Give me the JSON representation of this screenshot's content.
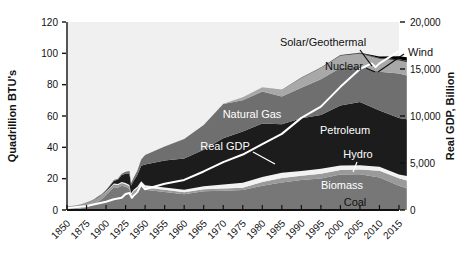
{
  "chart_data": {
    "type": "area",
    "title": "",
    "subtitle": "",
    "stacked": true,
    "grid": false,
    "legend_position": "inline-annotations",
    "xlabel": "",
    "ylabel": "Quadrillion BTU's",
    "y2label": "Real GDP, Billion",
    "ylim": [
      0,
      120
    ],
    "y2lim": [
      0,
      20000
    ],
    "yticks": [
      "0",
      "20",
      "40",
      "60",
      "80",
      "100",
      "120"
    ],
    "ytick_values": [
      0,
      20,
      40,
      60,
      80,
      100,
      120
    ],
    "y2ticks": [
      "0",
      "5,000",
      "10,000",
      "15,000",
      "20,000"
    ],
    "y2tick_values": [
      0,
      5000,
      10000,
      15000,
      20000
    ],
    "xticks": [
      "1850",
      "1875",
      "1900",
      "1925",
      "1950",
      "1955",
      "1960",
      "1965",
      "1970",
      "1975",
      "1980",
      "1985",
      "1990",
      "1995",
      "2000",
      "2005",
      "2010",
      "2015"
    ],
    "x": [
      1850,
      1855,
      1860,
      1865,
      1870,
      1875,
      1880,
      1885,
      1890,
      1895,
      1900,
      1905,
      1910,
      1915,
      1920,
      1925,
      1930,
      1932,
      1935,
      1940,
      1945,
      1950,
      1955,
      1960,
      1965,
      1970,
      1975,
      1980,
      1985,
      1990,
      1995,
      2000,
      2005,
      2010,
      2015,
      2017
    ],
    "series": [
      {
        "name": "Coal",
        "color": "#777777",
        "label_color": "#111111",
        "values": [
          0.2,
          0.3,
          0.5,
          0.8,
          1.2,
          1.8,
          2.6,
          3.8,
          5.5,
          7.2,
          9.5,
          12.0,
          14.5,
          14.2,
          15.5,
          14.8,
          13.6,
          8.5,
          10.5,
          12.5,
          15.5,
          12.9,
          11.5,
          10.1,
          11.9,
          12.3,
          12.7,
          15.4,
          17.5,
          19.2,
          20.1,
          22.6,
          22.8,
          20.8,
          15.5,
          13.9
        ]
      },
      {
        "name": "Biomass",
        "color": "#9a9a9a",
        "label_color": "#111111",
        "values": [
          2.1,
          2.2,
          2.4,
          2.5,
          2.6,
          2.7,
          2.8,
          2.7,
          2.6,
          2.4,
          2.2,
          2.0,
          1.9,
          1.8,
          1.7,
          1.6,
          1.5,
          1.4,
          1.4,
          1.4,
          1.4,
          1.5,
          1.4,
          1.3,
          1.3,
          1.4,
          1.5,
          2.5,
          2.9,
          2.7,
          3.0,
          3.0,
          3.1,
          4.3,
          4.7,
          5.0
        ]
      },
      {
        "name": "Hydro",
        "color": "#f2f2f2",
        "label_color": "#111111",
        "values": [
          0.0,
          0.0,
          0.0,
          0.0,
          0.0,
          0.0,
          0.0,
          0.0,
          0.05,
          0.1,
          0.25,
          0.4,
          0.5,
          0.6,
          0.7,
          0.8,
          0.8,
          0.8,
          0.9,
          0.9,
          1.4,
          1.4,
          1.4,
          1.6,
          2.0,
          2.6,
          3.2,
          3.1,
          3.4,
          3.0,
          3.2,
          2.8,
          2.7,
          2.5,
          2.4,
          2.8
        ]
      },
      {
        "name": "Petroleum",
        "color": "#1c1c1c",
        "label_color": "#ffffff",
        "values": [
          0.0,
          0.0,
          0.0,
          0.05,
          0.1,
          0.15,
          0.2,
          0.25,
          0.3,
          0.4,
          0.6,
          1.0,
          1.8,
          2.7,
          4.4,
          6.0,
          7.0,
          5.0,
          5.5,
          7.5,
          10.0,
          13.3,
          17.3,
          19.9,
          23.2,
          29.5,
          32.7,
          34.2,
          30.9,
          33.6,
          34.4,
          38.3,
          40.4,
          35.9,
          36.1,
          36.2
        ]
      },
      {
        "name": "Natural Gas",
        "color": "#6f6f6f",
        "label_color": "#ffffff",
        "values": [
          0.0,
          0.0,
          0.0,
          0.0,
          0.05,
          0.1,
          0.15,
          0.2,
          0.25,
          0.3,
          0.25,
          0.35,
          0.5,
          0.7,
          0.8,
          1.2,
          2.0,
          1.6,
          1.9,
          2.7,
          3.9,
          6.0,
          9.0,
          12.4,
          15.8,
          21.8,
          19.9,
          20.4,
          17.8,
          19.6,
          22.7,
          23.9,
          22.6,
          24.7,
          28.4,
          28.0
        ]
      },
      {
        "name": "Nuclear",
        "color": "#a8a8a8",
        "label_color": "#111111",
        "values": [
          0,
          0,
          0,
          0,
          0,
          0,
          0,
          0,
          0,
          0,
          0,
          0,
          0,
          0,
          0,
          0,
          0,
          0,
          0,
          0,
          0,
          0,
          0,
          0.04,
          0.04,
          0.24,
          1.9,
          2.7,
          4.1,
          6.1,
          7.2,
          7.9,
          8.2,
          8.4,
          8.4,
          8.4
        ]
      },
      {
        "name": "Solar/Geothermal",
        "color": "#3a3a3a",
        "label_color": "#111111",
        "values": [
          0,
          0,
          0,
          0,
          0,
          0,
          0,
          0,
          0,
          0,
          0,
          0,
          0,
          0,
          0,
          0,
          0,
          0,
          0,
          0,
          0,
          0,
          0,
          0.0,
          0.0,
          0.01,
          0.07,
          0.11,
          0.2,
          0.35,
          0.4,
          0.4,
          0.44,
          0.5,
          0.78,
          0.9
        ]
      },
      {
        "name": "Wind",
        "color": "#000000",
        "label_color": "#111111",
        "values": [
          0,
          0,
          0,
          0,
          0,
          0,
          0,
          0,
          0,
          0,
          0,
          0,
          0,
          0,
          0,
          0,
          0,
          0,
          0,
          0,
          0,
          0,
          0,
          0,
          0,
          0,
          0,
          0,
          0.0,
          0.03,
          0.03,
          0.06,
          0.18,
          0.92,
          1.78,
          2.35
        ]
      }
    ],
    "line_series": {
      "name": "Real GDP",
      "color": "#ffffff",
      "axis": "right",
      "units": "Billion",
      "x": [
        1850,
        1875,
        1900,
        1910,
        1920,
        1925,
        1930,
        1933,
        1935,
        1940,
        1945,
        1950,
        1955,
        1960,
        1965,
        1970,
        1975,
        1980,
        1985,
        1990,
        1995,
        2000,
        2005,
        2008,
        2009,
        2010,
        2015,
        2017
      ],
      "values": [
        200,
        420,
        880,
        1150,
        1300,
        1700,
        1800,
        1300,
        1500,
        1900,
        2700,
        2200,
        2800,
        3200,
        4100,
        5100,
        5900,
        7000,
        8100,
        9800,
        11000,
        13100,
        15000,
        15600,
        15200,
        15600,
        16900,
        17500
      ]
    },
    "annotations": [
      {
        "text": "Solar/Geothermal",
        "color": "#111111",
        "leader": true
      },
      {
        "text": "Wind",
        "color": "#111111",
        "leader": true
      },
      {
        "text": "Nuclear",
        "color": "#111111",
        "leader": true
      },
      {
        "text": "Natural Gas",
        "color": "#ffffff",
        "leader": false
      },
      {
        "text": "Real GDP",
        "color": "#ffffff",
        "leader": true
      },
      {
        "text": "Petroleum",
        "color": "#ffffff",
        "leader": false
      },
      {
        "text": "Hydro",
        "color": "#ffffff",
        "leader": true
      },
      {
        "text": "Biomass",
        "color": "#ffffff",
        "leader": false
      },
      {
        "text": "Coal",
        "color": "#111111",
        "leader": false
      }
    ]
  },
  "labels": {
    "y_axis_title": "Quadrillion BTU's",
    "y2_axis_title": "Real GDP, Billion",
    "solar_geothermal": "Solar/Geothermal",
    "wind": "Wind",
    "nuclear": "Nuclear",
    "natural_gas": "Natural Gas",
    "real_gdp": "Real GDP",
    "petroleum": "Petroleum",
    "hydro": "Hydro",
    "biomass": "Biomass",
    "coal": "Coal"
  },
  "colors": {
    "plot_background": "#f0f0f0",
    "page_background": "#ffffff",
    "axis": "#111111",
    "gdp_line": "#ffffff"
  }
}
